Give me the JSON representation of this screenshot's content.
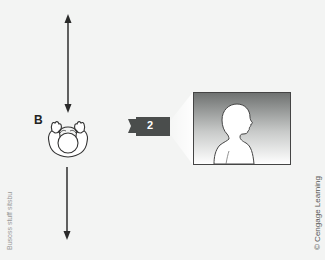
{
  "diagram": {
    "subject_label": "B",
    "camera_label": "2",
    "credit": "© Cengage Learning",
    "left_margin_text": "Busoss stuff sitsbu",
    "colors": {
      "background": "#f3f4f3",
      "line": "#333333",
      "camera": "#4a4d4c",
      "frame_top": "#6b6e6d",
      "frame_bottom": "#ffffff"
    },
    "elements": [
      {
        "type": "arrow",
        "direction": "vertical-bidirectional",
        "x": 68,
        "y1": 15,
        "y2": 112
      },
      {
        "type": "person-top-view",
        "label": "B",
        "cx": 68,
        "cy": 138
      },
      {
        "type": "arrow",
        "direction": "down",
        "x": 67,
        "y1": 167,
        "y2": 240
      },
      {
        "type": "camera",
        "number": "2",
        "facing": "right"
      },
      {
        "type": "frame",
        "content": "silhouette head-and-shoulders profile facing right"
      }
    ]
  }
}
